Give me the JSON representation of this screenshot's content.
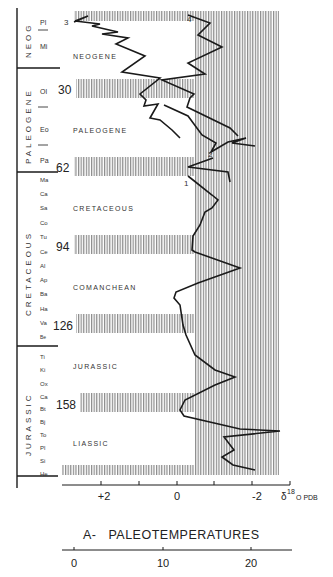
{
  "figure": {
    "title": "A-   PALEOTEMPERATURES",
    "axis_unit_label": "δ18O PDB",
    "axis_unit_prefix": "δ",
    "axis_unit_sup": "18",
    "axis_unit_suffix": "O PDB",
    "d18o_ticks": [
      {
        "label": "+2",
        "value": 2
      },
      {
        "label": "0",
        "value": 0
      },
      {
        "label": "-2",
        "value": -2
      }
    ],
    "temperature_ticks": [
      {
        "label": "0",
        "value": 0
      },
      {
        "label": "10",
        "value": 10
      },
      {
        "label": "20",
        "value": 20
      }
    ]
  },
  "periods": [
    {
      "label": "NEOG",
      "y0": 8,
      "y1": 68
    },
    {
      "label": "PALEOGENE",
      "y0": 68,
      "y1": 172
    },
    {
      "label": "CRETACEOUS",
      "y0": 172,
      "y1": 346
    },
    {
      "label": "JURASSIC",
      "y0": 346,
      "y1": 478
    }
  ],
  "stages": [
    "Pl",
    "Mi",
    "Ol",
    "Eo",
    "Pa",
    "Ma",
    "Ca",
    "Sa",
    "Co",
    "Tu",
    "Ce",
    "Al",
    "Ap",
    "Ba",
    "Ha",
    "Va",
    "Be",
    "Ti",
    "Ki",
    "Ox",
    "Ca",
    "Bt",
    "Bj",
    "To",
    "Pl",
    "Si",
    "He"
  ],
  "age_markers": [
    {
      "label": "3",
      "y": 20
    },
    {
      "label": "30",
      "y": 90
    },
    {
      "label": "62",
      "y": 166
    },
    {
      "label": "94",
      "y": 246
    },
    {
      "label": "126",
      "y": 325
    },
    {
      "label": "158",
      "y": 404
    }
  ],
  "interval_labels": [
    "NEOGENE",
    "PALEOGENE",
    "CRETACEOUS",
    "COMANCHEAN",
    "JURASSIC",
    "LIASSIC"
  ],
  "curve_numbers": [
    "1",
    "2",
    "3",
    "4"
  ],
  "colors": {
    "ink": "#1a1a1a",
    "hatch": "#8a8a8a",
    "paper": "#ffffff"
  },
  "chart_data": {
    "type": "line",
    "title": "A- PALEOTEMPERATURES",
    "xlabel": "δ18O PDB",
    "ylabel": "Geologic time (Ma)",
    "x_axis_reversed": true,
    "xlim": [
      3,
      -2.8
    ],
    "secondary_x": {
      "label": "Temperature (°C)",
      "ticks": [
        0,
        10,
        20
      ]
    },
    "y_tick_labels_ma": [
      3,
      30,
      62,
      94,
      126,
      158
    ],
    "series": [
      {
        "name": "Curve 3 (Neogene–Paleogene, benthic)",
        "points_age_d18o": [
          [
            2,
            2.2
          ],
          [
            3,
            3.0
          ],
          [
            8,
            1.6
          ],
          [
            12,
            1.8
          ],
          [
            16,
            1.0
          ],
          [
            20,
            1.4
          ],
          [
            25,
            0.6
          ],
          [
            28,
            0.8
          ],
          [
            32,
            0.6
          ],
          [
            36,
            0.4
          ],
          [
            38,
            0.8
          ],
          [
            42,
            0.2
          ],
          [
            46,
            -0.2
          ],
          [
            52,
            -0.6
          ],
          [
            58,
            -1.0
          ],
          [
            60,
            -1.4
          ]
        ]
      },
      {
        "name": "Curve 4 (surface)",
        "points_age_d18o": [
          [
            2,
            0.2
          ],
          [
            5,
            -0.6
          ],
          [
            10,
            -0.2
          ],
          [
            14,
            -1.2
          ],
          [
            20,
            -0.4
          ],
          [
            25,
            -0.7
          ],
          [
            30,
            0.1
          ],
          [
            35,
            -0.2
          ],
          [
            40,
            -0.6
          ],
          [
            48,
            -1.1
          ],
          [
            56,
            -1.6
          ]
        ]
      },
      {
        "name": "Curve 2",
        "points_age_d18o": [
          [
            60,
            -1.6
          ],
          [
            62,
            -1.0
          ],
          [
            64,
            0.0
          ],
          [
            66,
            -0.8
          ],
          [
            70,
            -1.2
          ]
        ]
      },
      {
        "name": "Curve 1 (Cretaceous–Jurassic)",
        "points_age_d18o": [
          [
            66,
            0.0
          ],
          [
            72,
            -0.8
          ],
          [
            78,
            -1.0
          ],
          [
            82,
            -0.6
          ],
          [
            88,
            -0.4
          ],
          [
            94,
            0.2
          ],
          [
            100,
            -0.4
          ],
          [
            110,
            -1.4
          ],
          [
            118,
            0.6
          ],
          [
            124,
            0.4
          ],
          [
            128,
            0.2
          ],
          [
            136,
            -0.2
          ],
          [
            144,
            -0.8
          ],
          [
            150,
            -1.4
          ],
          [
            158,
            0.2
          ],
          [
            164,
            -0.2
          ],
          [
            168,
            -2.6
          ],
          [
            172,
            -0.8
          ],
          [
            176,
            -1.2
          ],
          [
            180,
            -0.8
          ],
          [
            186,
            -2.0
          ]
        ]
      }
    ]
  }
}
